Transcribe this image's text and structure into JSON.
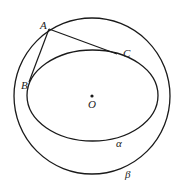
{
  "diagram": {
    "labels": {
      "A": "A",
      "B": "B",
      "C": "C",
      "O": "O",
      "alpha": "α",
      "beta": "β"
    },
    "colors": {
      "stroke": "#1a1a1a",
      "background": "#ffffff"
    }
  }
}
